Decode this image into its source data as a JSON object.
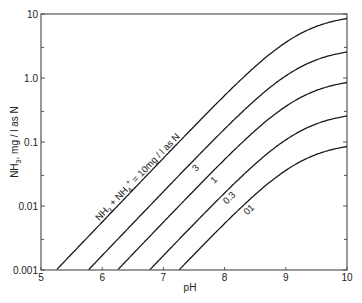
{
  "chart_data": {
    "type": "line",
    "title": "",
    "xlabel": "pH",
    "ylabel": "NH3, mg / l as N",
    "ylabel_parts": {
      "main": "NH",
      "sub": "3",
      "rest": ", mg / l as N"
    },
    "xlim": [
      5,
      10
    ],
    "ylim": [
      0.001,
      10
    ],
    "yscale": "log",
    "grid": false,
    "x_ticks": [
      5,
      6,
      7,
      8,
      9,
      10
    ],
    "x_tick_labels": [
      "5",
      "6",
      "7",
      "8",
      "9",
      "10"
    ],
    "y_ticks": [
      0.001,
      0.01,
      0.1,
      1.0,
      10
    ],
    "y_tick_labels": [
      "0.001",
      "0.01",
      "0.1",
      "1.0",
      "10"
    ],
    "y_minor_ticks": [
      0.003,
      0.03,
      0.3,
      3
    ],
    "pKa": 9.25,
    "x": [
      5.0,
      5.25,
      5.5,
      5.75,
      6.0,
      6.25,
      6.5,
      6.75,
      7.0,
      7.25,
      7.5,
      7.75,
      8.0,
      8.25,
      8.5,
      8.75,
      9.0,
      9.25,
      9.5,
      9.75,
      10.0
    ],
    "series": [
      {
        "name": "NH3 + NH4+ = 10 mg/l as N",
        "label": "NH3 + NH4+ = 10mg / l as N",
        "total": 10,
        "values": [
          0.00056,
          0.001,
          0.00178,
          0.00316,
          0.00562,
          0.00999,
          0.0178,
          0.0315,
          0.0559,
          0.099,
          0.173,
          0.297,
          0.491,
          0.756,
          1.057,
          1.4,
          1.78,
          2.5,
          3.6,
          5.0,
          8.49
        ]
      },
      {
        "name": "3",
        "label": "3",
        "total": 3,
        "values": [
          0.00017,
          0.0003,
          0.00053,
          0.00095,
          0.00169,
          0.003,
          0.00533,
          0.00946,
          0.0168,
          0.0297,
          0.0519,
          0.0891,
          0.147,
          0.227,
          0.317,
          0.42,
          0.534,
          0.75,
          1.08,
          1.5,
          2.55
        ]
      },
      {
        "name": "1",
        "label": "1",
        "total": 1,
        "values": [
          5.6e-05,
          0.0001,
          0.000178,
          0.000316,
          0.000562,
          0.000999,
          0.00178,
          0.00315,
          0.00559,
          0.0099,
          0.0173,
          0.0297,
          0.0491,
          0.0756,
          0.106,
          0.14,
          0.178,
          0.25,
          0.36,
          0.5,
          0.849
        ]
      },
      {
        "name": "0.3",
        "label": "0.3",
        "total": 0.3,
        "values": [
          1.7e-05,
          3e-05,
          5.3e-05,
          9.5e-05,
          0.000169,
          0.0003,
          0.000533,
          0.000946,
          0.00168,
          0.00297,
          0.00519,
          0.00891,
          0.0147,
          0.0227,
          0.0317,
          0.042,
          0.0534,
          0.075,
          0.108,
          0.15,
          0.255
        ]
      },
      {
        "name": "0.1",
        "label": "01",
        "total": 0.1,
        "values": [
          5.6e-06,
          1e-05,
          1.78e-05,
          3.16e-05,
          5.62e-05,
          9.99e-05,
          0.000178,
          0.000315,
          0.000559,
          0.00099,
          0.00173,
          0.00297,
          0.00491,
          0.00756,
          0.0106,
          0.014,
          0.0178,
          0.025,
          0.036,
          0.05,
          0.0849
        ]
      }
    ],
    "curve_labels": [
      {
        "series": 0,
        "text_main": "NH",
        "sub1": "3",
        "mid": " + NH",
        "sub2": "4",
        "sup2": "+",
        "tail": " = 10mg / l as N",
        "at_pH": 7.05
      },
      {
        "series": 1,
        "text": "3",
        "at_pH": 7.48
      },
      {
        "series": 2,
        "text": "1",
        "at_pH": 7.78
      },
      {
        "series": 3,
        "text": "0.3",
        "at_pH": 8.03
      },
      {
        "series": 4,
        "text": "01",
        "at_pH": 8.35
      }
    ],
    "x_intercepts_at_ymin": [
      5.25,
      5.78,
      6.25,
      6.77,
      7.25
    ]
  },
  "colors": {
    "line": "#1a1a1a",
    "axis": "#555555",
    "text": "#222222",
    "background": "#ffffff"
  }
}
